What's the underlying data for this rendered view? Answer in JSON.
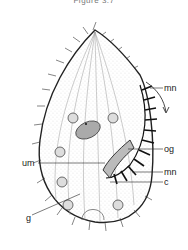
{
  "figure": {
    "caption": "Figure 3.7",
    "labels": [
      {
        "id": "mn_top",
        "text": "mn"
      },
      {
        "id": "og",
        "text": "og"
      },
      {
        "id": "um",
        "text": "um"
      },
      {
        "id": "mn_bottom",
        "text": "mn"
      },
      {
        "id": "c",
        "text": "c"
      },
      {
        "id": "g",
        "text": "g"
      }
    ],
    "colors": {
      "ink": "#222222",
      "stipple": "#888888",
      "background": "#ffffff"
    }
  }
}
